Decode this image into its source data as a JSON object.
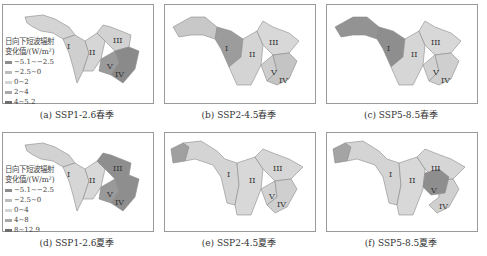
{
  "figure": {
    "panels": [
      {
        "id": "a",
        "caption": "(a) SSP1-2.6春季",
        "scenario": "SSP1-2.6",
        "season": "春季",
        "fills": {
          "I": "#cfcfcf",
          "II": "#d6d6d6",
          "III": "#d2d2d2",
          "IV": "#8a8a8a",
          "V": "#9a9a9a",
          "west": "#d4d4d4"
        },
        "legend": {
          "title_line1": "日向下短波辐射",
          "title_line2": "变化值/(W/m²)",
          "items": [
            {
              "label": "−5.1~−2.5",
              "color": "#8c8c8c"
            },
            {
              "label": "−2.5~0",
              "color": "#bdbdbd"
            },
            {
              "label": "0~2",
              "color": "#d4d4d4"
            },
            {
              "label": "2~4",
              "color": "#a8a8a8"
            },
            {
              "label": "4~5.2",
              "color": "#6e6e6e"
            }
          ]
        }
      },
      {
        "id": "b",
        "caption": "(b) SSP2-4.5春季",
        "scenario": "SSP2-4.5",
        "season": "春季",
        "fills": {
          "I": "#9c9c9c",
          "II": "#d4d4d4",
          "III": "#d8d8d8",
          "IV": "#c4c4c4",
          "V": "#cdcdcd",
          "west": "#c8c8c8"
        }
      },
      {
        "id": "c",
        "caption": "(c) SSP5-8.5春季",
        "scenario": "SSP5-8.5",
        "season": "春季",
        "fills": {
          "I": "#8e8e8e",
          "II": "#d6d6d6",
          "III": "#d8d8d8",
          "IV": "#cfcfcf",
          "V": "#d2d2d2",
          "west": "#939393"
        }
      },
      {
        "id": "d",
        "caption": "(d) SSP1-2.6夏季",
        "scenario": "SSP1-2.6",
        "season": "夏季",
        "fills": {
          "I": "#d6d6d6",
          "II": "#d8d8d8",
          "III": "#8e8e8e",
          "IV": "#8e8e8e",
          "V": "#999999",
          "west": "#d2d2d2"
        },
        "legend": {
          "title_line1": "日向下短波辐射",
          "title_line2": "变化值/(W/m²)",
          "items": [
            {
              "label": "−5.1~−2.5",
              "color": "#8c8c8c"
            },
            {
              "label": "−2.5~0",
              "color": "#bdbdbd"
            },
            {
              "label": "0~4",
              "color": "#d4d4d4"
            },
            {
              "label": "4~8",
              "color": "#a8a8a8"
            },
            {
              "label": "8~12.9",
              "color": "#6e6e6e"
            }
          ]
        }
      },
      {
        "id": "e",
        "caption": "(e) SSP2-4.5夏季",
        "scenario": "SSP2-4.5",
        "season": "夏季",
        "fills": {
          "I": "#d4d4d4",
          "II": "#d8d8d8",
          "III": "#d6d6d6",
          "IV": "#cfcfcf",
          "V": "#d2d2d2",
          "west": "#a0a0a0"
        }
      },
      {
        "id": "f",
        "caption": "(f) SSP5-8.5夏季",
        "scenario": "SSP5-8.5",
        "season": "夏季",
        "fills": {
          "I": "#d4d4d4",
          "II": "#d8d8d8",
          "III": "#d6d6d6",
          "IV": "#d0d0d0",
          "V": "#8e8e8e",
          "west": "#a4a4a4"
        }
      }
    ],
    "region_labels": {
      "I": "I",
      "II": "II",
      "III": "III",
      "IV": "IV",
      "V": "V"
    }
  }
}
